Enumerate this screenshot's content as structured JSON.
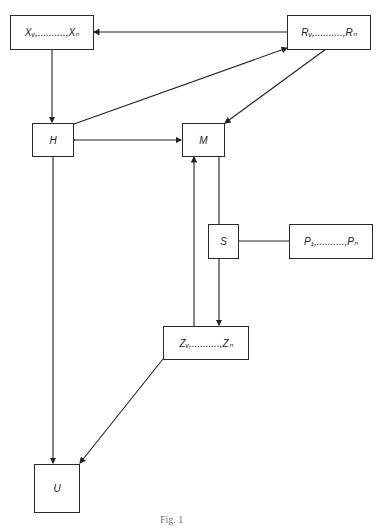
{
  "diagram": {
    "nodes": {
      "x": {
        "label": "Xᵥ,..........,Xₙ"
      },
      "r": {
        "label": "Rᵥ,..........,Rₙ"
      },
      "h": {
        "label": "H"
      },
      "m": {
        "label": "M"
      },
      "s": {
        "label": "S"
      },
      "p": {
        "label": "P₁,..........,Pₙ"
      },
      "z": {
        "label": "Zᵥ,..........,Zₙ"
      },
      "u": {
        "label": "U"
      }
    },
    "edges": [
      {
        "from": "R",
        "to": "X"
      },
      {
        "from": "X",
        "to": "H"
      },
      {
        "from": "H",
        "to": "R"
      },
      {
        "from": "R",
        "to": "M"
      },
      {
        "from": "H",
        "to": "M",
        "bidirectional": true
      },
      {
        "from": "M",
        "to": "Z",
        "via": "S"
      },
      {
        "from": "Z",
        "to": "M"
      },
      {
        "from": "S",
        "to": "P",
        "undirected": true
      },
      {
        "from": "Z",
        "to": "U"
      },
      {
        "from": "H",
        "to": "U"
      }
    ],
    "caption": "Fig. 1"
  }
}
